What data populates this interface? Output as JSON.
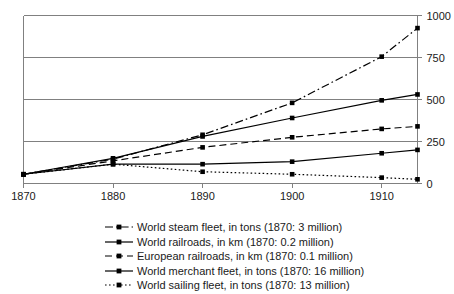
{
  "chart_data": {
    "type": "line",
    "title": "",
    "subtitle": "",
    "xlabel": "",
    "ylabel": "",
    "x": [
      1870,
      1880,
      1890,
      1900,
      1910,
      1914
    ],
    "xlim": [
      1870,
      1914
    ],
    "ylim": [
      0,
      1000
    ],
    "xticks": [
      1870,
      1880,
      1890,
      1900,
      1910
    ],
    "xtick_labels": [
      "1870",
      "1880",
      "1890",
      "1900",
      "1910"
    ],
    "yticks": [
      0,
      250,
      500,
      750,
      1000
    ],
    "ytick_labels": [
      "0",
      "250",
      "500",
      "750",
      "1000"
    ],
    "y_axis_position": "right",
    "grid": "horizontal",
    "legend_position": "bottom",
    "series": [
      {
        "name": "World steam fleet, in tons (1870: 3 million)",
        "linestyle": "dash-dot",
        "marker": "square",
        "color": "#000000",
        "values": [
          55,
          145,
          290,
          480,
          755,
          925
        ]
      },
      {
        "name": "World railroads, in km (1870: 0.2 million)",
        "linestyle": "solid",
        "marker": "square",
        "color": "#000000",
        "values": [
          55,
          150,
          280,
          390,
          495,
          530
        ]
      },
      {
        "name": "European railroads, in km (1870: 0.1 million)",
        "linestyle": "dashed",
        "marker": "square",
        "color": "#000000",
        "values": [
          55,
          135,
          215,
          275,
          325,
          340
        ]
      },
      {
        "name": "World merchant fleet, in tons (1870: 16 million)",
        "linestyle": "solid",
        "marker": "square",
        "color": "#000000",
        "values": [
          55,
          115,
          115,
          130,
          180,
          200
        ]
      },
      {
        "name": "World sailing fleet, in tons (1870: 13 million)",
        "linestyle": "dotted",
        "marker": "square",
        "color": "#000000",
        "values": [
          55,
          115,
          70,
          55,
          35,
          25
        ]
      }
    ]
  },
  "legend": {
    "items": [
      {
        "label": "World steam fleet, in tons (1870: 3 million)",
        "linestyle": "dash-dot"
      },
      {
        "label": "World railroads, in km (1870: 0.2 million)",
        "linestyle": "solid"
      },
      {
        "label": "European railroads, in km (1870: 0.1 million)",
        "linestyle": "dashed"
      },
      {
        "label": "World merchant fleet, in tons (1870: 16 million)",
        "linestyle": "solid"
      },
      {
        "label": "World sailing fleet, in tons (1870: 13 million)",
        "linestyle": "dotted"
      }
    ]
  },
  "colors": {
    "ink": "#000000",
    "axis": "#808080",
    "background": "#ffffff"
  }
}
